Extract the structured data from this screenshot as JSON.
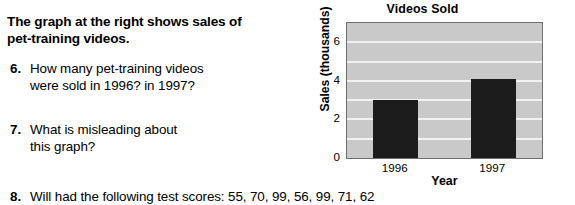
{
  "worksheet": {
    "intro": {
      "lines": [
        "The graph at the right shows sales of",
        "pet-training videos."
      ]
    },
    "questions": [
      {
        "number": "6.",
        "lines": [
          "How many pet-training videos",
          "were sold in 1996? in 1997?"
        ]
      },
      {
        "number": "7.",
        "lines": [
          "What is misleading about",
          "this graph?"
        ]
      },
      {
        "number": "8.",
        "lines": [
          "Will had the following test scores: 55, 70, 99, 56, 99, 71, 62"
        ]
      }
    ]
  },
  "chart_data": {
    "type": "bar",
    "title": "Videos Sold",
    "xlabel": "Year",
    "ylabel": "Sales (thousands)",
    "categories": [
      "1996",
      "1997"
    ],
    "values": [
      3.0,
      4.1
    ],
    "ylim": [
      0,
      7
    ],
    "yticks": [
      0,
      2,
      4,
      6
    ],
    "ytick_labels": [
      "0",
      "2",
      "4",
      "6"
    ],
    "gridlines": [
      1,
      2,
      3,
      4,
      5,
      6
    ],
    "grid": true,
    "legend": "none",
    "plot_background": "#c9c9c9",
    "bar_color": "#1c1c1c",
    "gridline_color": "#f2f2f2",
    "frame_color": "#6e6e6e"
  }
}
